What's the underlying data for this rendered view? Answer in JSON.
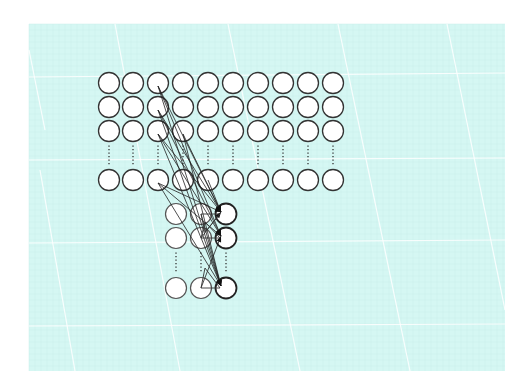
{
  "figure": {
    "type": "neural-network-connectivity-diagram",
    "width": 529,
    "height": 379,
    "colors": {
      "background": "#ffffff",
      "panel": "#d5f7f3",
      "grid_line": "#ffffff",
      "node_fill": "#ffffff",
      "node_stroke": "#333333",
      "connection": "#222222"
    },
    "panel": {
      "x": 29,
      "y": 24,
      "w": 476,
      "h": 347
    },
    "node_radius": 10.5,
    "upper_layer": {
      "columns": [
        109,
        133,
        158,
        183,
        208,
        233,
        258,
        283,
        308,
        333
      ],
      "rows": [
        83,
        107,
        131,
        180
      ],
      "ellipsis_between_rows": [
        131,
        180
      ]
    },
    "lower_layer": {
      "columns": [
        176,
        201,
        226
      ],
      "rows": [
        214,
        238,
        288
      ],
      "ellipsis_between_rows": [
        238,
        288
      ],
      "target_column_index": 2
    },
    "connections": [
      {
        "from": [
          158,
          86
        ],
        "to": [
          221,
          212
        ]
      },
      {
        "from": [
          158,
          86
        ],
        "to": [
          221,
          236
        ]
      },
      {
        "from": [
          158,
          86
        ],
        "to": [
          221,
          286
        ]
      },
      {
        "from": [
          158,
          110
        ],
        "to": [
          221,
          212
        ]
      },
      {
        "from": [
          158,
          110
        ],
        "to": [
          221,
          236
        ]
      },
      {
        "from": [
          158,
          110
        ],
        "to": [
          221,
          286
        ]
      },
      {
        "from": [
          158,
          134
        ],
        "to": [
          221,
          212
        ]
      },
      {
        "from": [
          158,
          134
        ],
        "to": [
          221,
          236
        ]
      },
      {
        "from": [
          158,
          134
        ],
        "to": [
          221,
          286
        ]
      },
      {
        "from": [
          183,
          134
        ],
        "to": [
          221,
          212
        ]
      },
      {
        "from": [
          183,
          134
        ],
        "to": [
          221,
          286
        ]
      },
      {
        "from": [
          208,
          180
        ],
        "to": [
          221,
          212
        ]
      },
      {
        "from": [
          158,
          183
        ],
        "to": [
          221,
          212
        ]
      },
      {
        "from": [
          158,
          183
        ],
        "to": [
          221,
          236
        ]
      },
      {
        "from": [
          158,
          183
        ],
        "to": [
          221,
          286
        ]
      },
      {
        "from": [
          201,
          214
        ],
        "to": [
          221,
          286
        ]
      },
      {
        "from": [
          201,
          238
        ],
        "to": [
          221,
          212
        ]
      },
      {
        "from": [
          201,
          288
        ],
        "to": [
          221,
          236
        ]
      }
    ],
    "triangles": [
      [
        [
          201,
          214
        ],
        [
          220,
          214
        ],
        [
          205,
          232
        ]
      ],
      [
        [
          201,
          238
        ],
        [
          220,
          238
        ],
        [
          205,
          222
        ]
      ],
      [
        [
          201,
          288
        ],
        [
          220,
          288
        ],
        [
          205,
          268
        ]
      ]
    ],
    "h_gridlines": [
      {
        "x1": 29,
        "y1": 77,
        "x2": 505,
        "y2": 73
      },
      {
        "x1": 29,
        "y1": 160,
        "x2": 505,
        "y2": 158
      },
      {
        "x1": 29,
        "y1": 243,
        "x2": 505,
        "y2": 240
      },
      {
        "x1": 29,
        "y1": 326,
        "x2": 505,
        "y2": 324
      }
    ],
    "d_gridlines": [
      {
        "x1": 40,
        "y1": 170,
        "x2": 75,
        "y2": 371
      },
      {
        "x1": 115,
        "y1": 24,
        "x2": 180,
        "y2": 371
      },
      {
        "x1": 228,
        "y1": 24,
        "x2": 300,
        "y2": 371
      },
      {
        "x1": 338,
        "y1": 24,
        "x2": 410,
        "y2": 371
      },
      {
        "x1": 447,
        "y1": 24,
        "x2": 505,
        "y2": 310
      },
      {
        "x1": 29,
        "y1": 50,
        "x2": 45,
        "y2": 130
      }
    ]
  }
}
